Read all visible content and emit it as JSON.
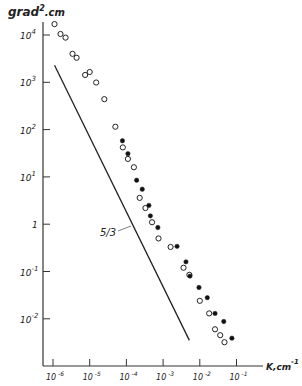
{
  "chart_data": {
    "type": "scatter",
    "title": "",
    "xlabel": "K, cm⁻¹",
    "ylabel": "grad².cm",
    "x_scale": "log",
    "y_scale": "log",
    "xlim": [
      1e-06,
      0.3
    ],
    "ylim": [
      0.002,
      30000
    ],
    "grid": false,
    "x_ticks": [
      "10⁻⁶",
      "10⁻⁵",
      "10⁻⁴",
      "10⁻³",
      "10⁻²",
      "10⁻¹"
    ],
    "y_ticks": [
      "10⁴",
      "10³",
      "10²",
      "10¹",
      "1",
      "10⁻¹",
      "10⁻²"
    ],
    "annotations": [
      {
        "text": "5/3",
        "note": "reference line slope -5/3"
      }
    ],
    "reference_line": {
      "label": "5/3",
      "slope": -1.6667,
      "from": {
        "k": 1.1e-06,
        "S": 2300
      },
      "to": {
        "k": 0.0052,
        "S": 0.0035
      }
    },
    "series": [
      {
        "name": "open circles",
        "marker": "open-circle",
        "points": [
          [
            1.1e-06,
            17000
          ],
          [
            1.6e-06,
            10500
          ],
          [
            2.2e-06,
            8800
          ],
          [
            3.4e-06,
            4000
          ],
          [
            4.4e-06,
            3300
          ],
          [
            7.5e-06,
            1430
          ],
          [
            1e-05,
            1650
          ],
          [
            1.5e-05,
            990
          ],
          [
            2.5e-05,
            440
          ],
          [
            5e-05,
            115
          ],
          [
            8e-05,
            42
          ],
          [
            0.00011,
            24
          ],
          [
            0.00016,
            16
          ],
          [
            0.00023,
            3.6
          ],
          [
            0.00033,
            2.2
          ],
          [
            0.0005,
            1.1
          ],
          [
            0.00075,
            0.5
          ],
          [
            0.0016,
            0.33
          ],
          [
            0.0036,
            0.12
          ],
          [
            0.0052,
            0.085
          ],
          [
            0.01,
            0.024
          ],
          [
            0.018,
            0.013
          ],
          [
            0.026,
            0.006
          ],
          [
            0.036,
            0.0045
          ],
          [
            0.047,
            0.0032
          ]
        ]
      },
      {
        "name": "filled circles",
        "marker": "filled-circle",
        "points": [
          [
            7.8e-05,
            58
          ],
          [
            0.00011,
            31
          ],
          [
            0.00019,
            8.5
          ],
          [
            0.00027,
            5.5
          ],
          [
            0.00041,
            2.5
          ],
          [
            0.00045,
            1.5
          ],
          [
            0.00072,
            0.85
          ],
          [
            0.0024,
            0.34
          ],
          [
            0.0042,
            0.16
          ],
          [
            0.0054,
            0.08
          ],
          [
            0.0095,
            0.046
          ],
          [
            0.016,
            0.028
          ],
          [
            0.026,
            0.013
          ],
          [
            0.045,
            0.0088
          ],
          [
            0.075,
            0.0039
          ]
        ]
      }
    ]
  },
  "axes": {
    "y_title_main": "grad",
    "y_title_sup": "2",
    "y_title_unit": ".cm",
    "x_title_main": "K,cm",
    "x_title_sup": "-1",
    "slope_label": "5/3",
    "x_tick_labels": [
      {
        "base": "10",
        "exp": "-6"
      },
      {
        "base": "10",
        "exp": "-5"
      },
      {
        "base": "10",
        "exp": "-4"
      },
      {
        "base": "10",
        "exp": "-3"
      },
      {
        "base": "10",
        "exp": "-2"
      },
      {
        "base": "10",
        "exp": "-1"
      }
    ],
    "y_tick_labels": [
      {
        "base": "10",
        "exp": "4"
      },
      {
        "base": "10",
        "exp": "3"
      },
      {
        "base": "10",
        "exp": "2"
      },
      {
        "base": "10",
        "exp": "1"
      },
      {
        "base": "1",
        "exp": ""
      },
      {
        "base": "10",
        "exp": "-1"
      },
      {
        "base": "10",
        "exp": "-2"
      }
    ]
  }
}
